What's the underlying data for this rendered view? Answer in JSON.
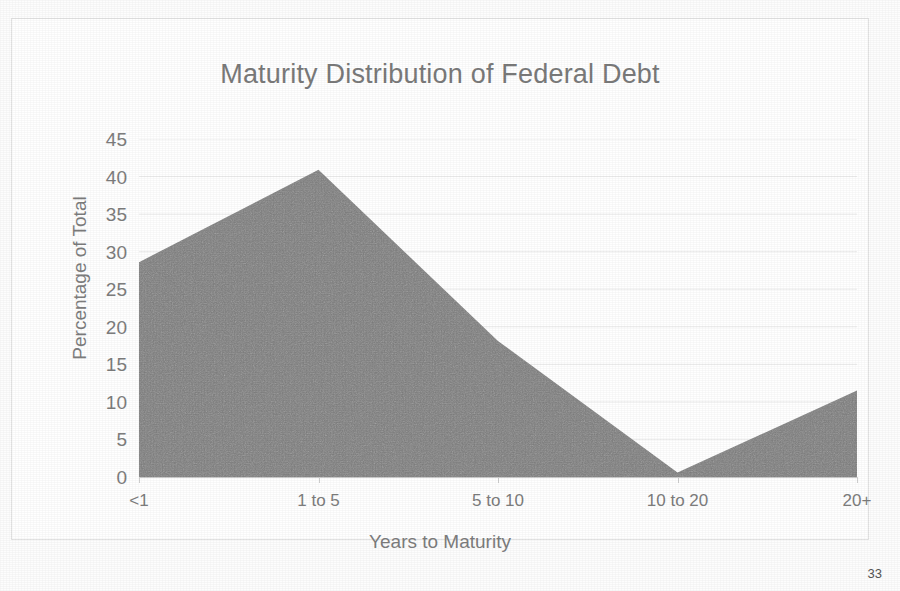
{
  "document": {
    "page_number": "33"
  },
  "chart_data": {
    "type": "area",
    "title": "Maturity Distribution of Federal Debt",
    "xlabel": "Years to Maturity",
    "ylabel": "Percentage of Total",
    "categories": [
      "<1",
      "1 to 5",
      "5 to 10",
      "10 to 20",
      "20+"
    ],
    "values": [
      28.6,
      40.9,
      18.1,
      0.6,
      11.5
    ],
    "ylim": [
      0,
      45
    ],
    "yticks": [
      "0",
      "5",
      "10",
      "15",
      "20",
      "25",
      "30",
      "35",
      "40",
      "45"
    ],
    "ytick_values": [
      0,
      5,
      10,
      15,
      20,
      25,
      30,
      35,
      40,
      45
    ],
    "grid": true,
    "legend": "none",
    "series_color": "#808080",
    "grid_color": "#ededed",
    "text_color": "#7d7d7d"
  }
}
